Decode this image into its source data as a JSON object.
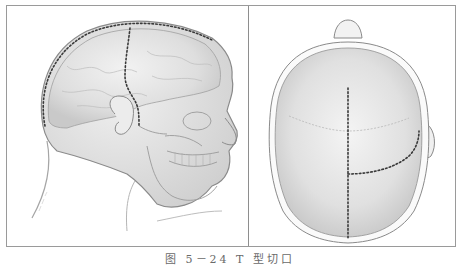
{
  "figure": {
    "caption": "图 5－24  T 型切口",
    "panels": [
      {
        "id": "lateral-view",
        "subject": "head-lateral-view-with-skull-and-brain",
        "incision_style": "dotted"
      },
      {
        "id": "superior-view",
        "subject": "skull-top-view",
        "incision_style": "dotted"
      }
    ]
  },
  "colors": {
    "frame": "#9a9a9a",
    "divider": "#8e8e8e",
    "incision_dots": "#3a3a3a",
    "outline": "#8a8a8a",
    "shading": "#d9d9d9",
    "caption": "#6a6a6a"
  }
}
